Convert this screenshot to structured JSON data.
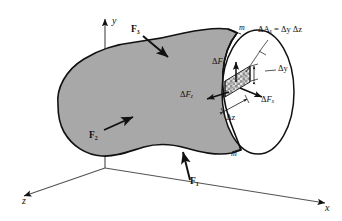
{
  "figure": {
    "kind": "engineering-mechanics-diagram",
    "colors": {
      "body_fill": "#a8a8a8",
      "cut_face_fill": "#ffffff",
      "outline": "#111111",
      "element_fill": "#cfcfcf",
      "background": "#ffffff"
    }
  },
  "axes": {
    "y_label": "y",
    "x_label": "x",
    "z_label": "z"
  },
  "forces": [
    {
      "id": "F1",
      "base": "F",
      "sub": "1",
      "label": "F₁"
    },
    {
      "id": "F2",
      "base": "F",
      "sub": "2",
      "label": "F₂"
    },
    {
      "id": "F3",
      "base": "F",
      "sub": "3",
      "label": "F₃"
    }
  ],
  "section": {
    "marker_top": "m",
    "marker_bottom": "m"
  },
  "element_forces": [
    {
      "id": "dFy",
      "delta": "Δ",
      "base": "F",
      "sub": "y",
      "direction": "up"
    },
    {
      "id": "dFx",
      "delta": "Δ",
      "base": "F",
      "sub": "x",
      "direction": "right"
    },
    {
      "id": "dFz",
      "delta": "Δ",
      "base": "F",
      "sub": "z",
      "direction": "left"
    }
  ],
  "dimensions": [
    {
      "id": "dy",
      "text": "Δy"
    },
    {
      "id": "dz",
      "text": "Δz"
    }
  ],
  "callout": {
    "lead": "ΔA",
    "lead_sub": "x",
    "equals": " = ",
    "expr": "Δy Δz",
    "full": "ΔAₓ = Δy Δz"
  }
}
